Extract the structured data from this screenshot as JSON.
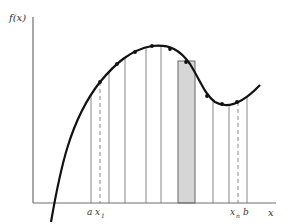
{
  "diagram": {
    "colors": {
      "background": "#ffffff",
      "axis": "#6e6e6e",
      "curve": "#111111",
      "partition_line": "#7a7a7a",
      "shaded_rect_fill": "#d6d6d6",
      "shaded_rect_stroke": "#666666",
      "dot": "#111111"
    },
    "axes": {
      "y_label": "f(x)",
      "x_label": "x",
      "origin": [
        33,
        203
      ],
      "y_top": 17,
      "x_end": 276
    },
    "tick_labels": {
      "a": "a",
      "x1": "x",
      "x1_sub": "1",
      "xn": "x",
      "xn_sub": "n",
      "b": "b"
    },
    "curve_path": "M51,222 C60,170 70,120 100,82 C115,64 130,50 152,46 C170,44 180,50 190,64 C200,80 205,95 215,102 C225,108 240,106 260,85",
    "partition_lines_x": [
      91,
      109,
      125,
      146,
      161,
      213,
      229,
      247
    ],
    "dashed_lines_x": [
      100,
      238
    ],
    "shaded_rect": {
      "x": 178,
      "width": 17,
      "top": 61
    },
    "sample_points": [
      [
        100,
        82
      ],
      [
        117,
        64
      ],
      [
        135,
        52
      ],
      [
        152,
        46
      ],
      [
        170,
        49
      ],
      [
        186,
        62
      ],
      [
        207,
        96
      ],
      [
        222,
        104
      ],
      [
        237,
        102
      ]
    ]
  }
}
